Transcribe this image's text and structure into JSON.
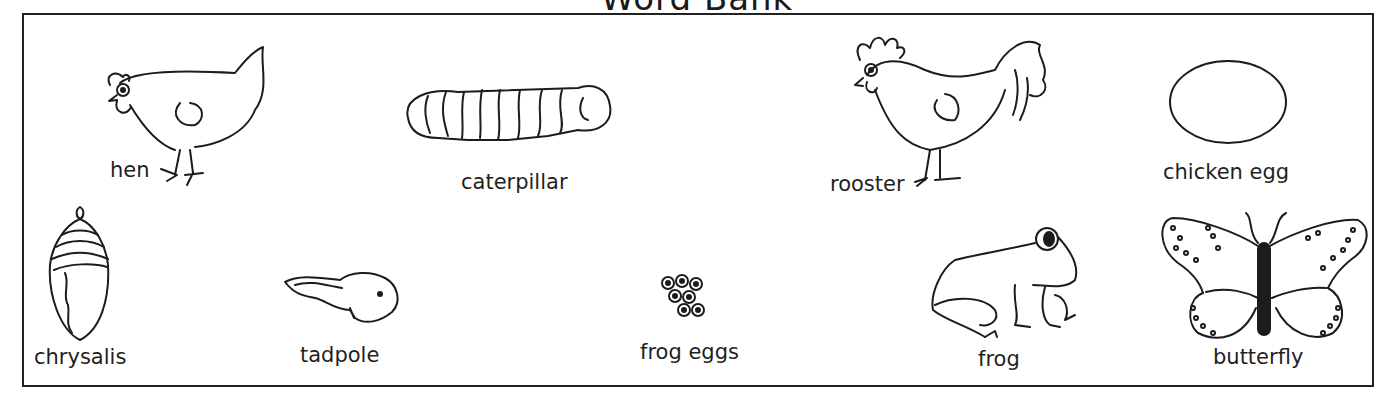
{
  "title": "Word Bank",
  "items": [
    {
      "id": "hen",
      "label": "hen",
      "row": 1
    },
    {
      "id": "caterpillar",
      "label": "caterpillar",
      "row": 1
    },
    {
      "id": "rooster",
      "label": "rooster",
      "row": 1
    },
    {
      "id": "chicken-egg",
      "label": "chicken egg",
      "row": 1
    },
    {
      "id": "chrysalis",
      "label": "chrysalis",
      "row": 2
    },
    {
      "id": "tadpole",
      "label": "tadpole",
      "row": 2
    },
    {
      "id": "frog-eggs",
      "label": "frog eggs",
      "row": 2
    },
    {
      "id": "frog",
      "label": "frog",
      "row": 2
    },
    {
      "id": "butterfly",
      "label": "butterfly",
      "row": 2
    }
  ]
}
